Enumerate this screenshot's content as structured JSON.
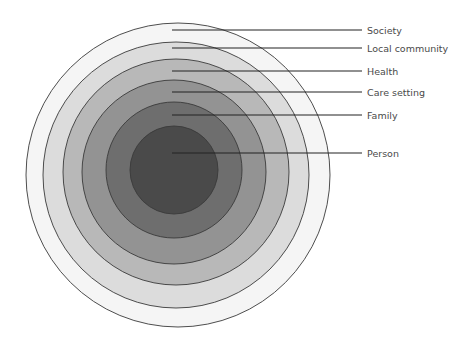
{
  "diagram": {
    "type": "concentric-circles",
    "title": "",
    "layers": [
      {
        "label": "Society",
        "fill": "#f5f5f5",
        "cx": 178,
        "cy": 175,
        "r": 152,
        "leader_y": 30
      },
      {
        "label": "Local community",
        "fill": "#dcdcdc",
        "cx": 176,
        "cy": 175,
        "r": 133,
        "leader_y": 48
      },
      {
        "label": "Health",
        "fill": "#b8b8b8",
        "cx": 176,
        "cy": 172,
        "r": 113,
        "leader_y": 71
      },
      {
        "label": "Care setting",
        "fill": "#939393",
        "cx": 174,
        "cy": 172,
        "r": 92,
        "leader_y": 92
      },
      {
        "label": "Family",
        "fill": "#6e6e6e",
        "cx": 174,
        "cy": 170,
        "r": 68,
        "leader_y": 115
      },
      {
        "label": "Person",
        "fill": "#4a4a4a",
        "cx": 174,
        "cy": 170,
        "r": 44,
        "leader_y": 153
      }
    ],
    "stroke": "#3a3a3a",
    "leader_color": "#222222",
    "leader_x_start": 172,
    "leader_x_end": 362,
    "label_x": 367
  }
}
